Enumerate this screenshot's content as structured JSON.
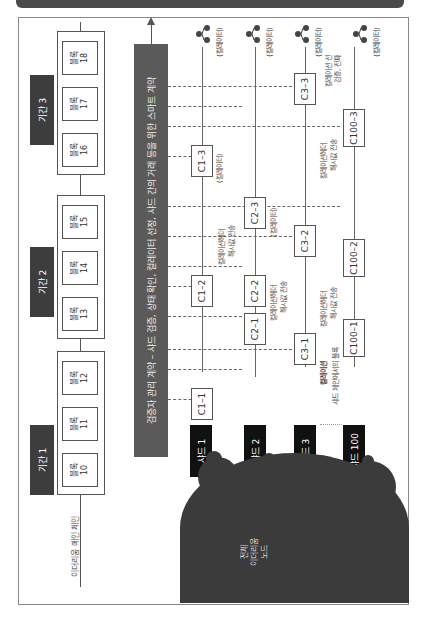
{
  "main_chain": {
    "label": "이더리움 메인 체인",
    "periods": [
      {
        "label": "기간 1",
        "blocks": [
          {
            "label": "블록",
            "num": "10"
          },
          {
            "label": "블록",
            "num": "11"
          },
          {
            "label": "블록",
            "num": "12"
          }
        ]
      },
      {
        "label": "기간 2",
        "blocks": [
          {
            "label": "블록",
            "num": "13"
          },
          {
            "label": "블록",
            "num": "14"
          },
          {
            "label": "블록",
            "num": "15"
          }
        ]
      },
      {
        "label": "기간 3",
        "blocks": [
          {
            "label": "블록",
            "num": "16"
          },
          {
            "label": "블록",
            "num": "17"
          },
          {
            "label": "블록",
            "num": "18"
          }
        ]
      }
    ]
  },
  "vmc_banner": "검증자 관리 계약 – 샤드 검증, 상태 확인, 컬레이터 선정, 샤드 간의 거래 등을 위한 스마트 계약",
  "shards": [
    {
      "label": "샤드 1",
      "collations": [
        "C1–1",
        "C1–2",
        "C1–3"
      ]
    },
    {
      "label": "샤드 2",
      "collations": [
        "C2–1",
        "C2–2",
        "C2–3"
      ]
    },
    {
      "label": "샤드 3",
      "collations": [
        "C3–1",
        "C3–2",
        "C3–3"
      ]
    },
    {
      "label": "샤드 100",
      "collations": [
        "C100–1",
        "C100–2",
        "C100–3"
      ]
    }
  ],
  "annotations": {
    "collator_paren": "(컬레이터)",
    "collator_hash_l1": "컬레이션헤더",
    "collator_hash_l2": "해시값 전송",
    "collation_title": "컬레이션",
    "collation_desc": "샤드 체인에서의 블록",
    "verify_l1": "컬레이션 선",
    "verify_l2": "검증, 전파",
    "full_nodes_l1": "전체",
    "full_nodes_l2": "이더리움",
    "full_nodes_l3": "노드"
  },
  "colors": {
    "dark": "#3b3b3b",
    "banner": "#5a5a5a",
    "shard_tag": "#111111",
    "line": "#555555"
  }
}
